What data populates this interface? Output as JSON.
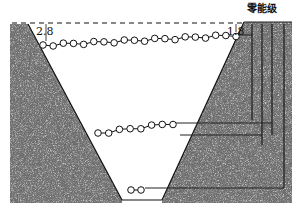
{
  "diagram": {
    "type": "potential-well",
    "zero_level_label": "零能级",
    "left_value_label": "2.8",
    "right_value_label": "1.8",
    "colors": {
      "background": "#ffffff",
      "wall_fill": "#5a5a5a",
      "wall_speckle_light": "#d8d8d8",
      "wall_speckle_dark": "#1a1a1a",
      "line": "#111111",
      "circle_fill": "#ffffff"
    },
    "levels": [
      {
        "name": "top-level",
        "circle_count": 20,
        "y_left": 45,
        "y_right": 35,
        "x_start": 43,
        "x_end": 236
      },
      {
        "name": "middle-level",
        "circle_count": 8,
        "y_left": 133,
        "y_right": 123,
        "x_start": 98,
        "x_end": 173
      },
      {
        "name": "bottom-level",
        "circle_count": 2,
        "y_left": 190,
        "y_right": 190,
        "x_start": 131,
        "x_end": 141
      }
    ]
  }
}
